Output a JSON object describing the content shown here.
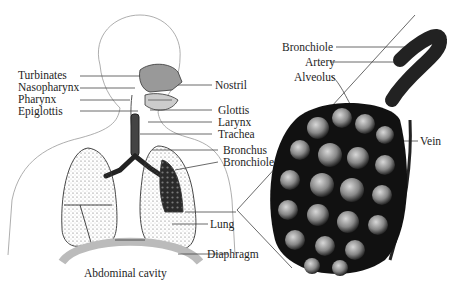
{
  "diagram": {
    "left_labels": {
      "turbinates": "Turbinates",
      "nasopharynx": "Nasopharynx",
      "pharynx": "Pharynx",
      "epiglottis": "Epiglottis"
    },
    "middle_labels": {
      "nostril": "Nostril",
      "glottis": "Glottis",
      "larynx": "Larynx",
      "trachea": "Trachea",
      "bronchus": "Bronchus",
      "bronchiole": "Bronchiole",
      "lung": "Lung",
      "diaphragm": "Diaphragm"
    },
    "bottom_label": "Abdominal cavity",
    "detail_labels": {
      "bronchiole": "Bronchiole",
      "artery": "Artery",
      "alveolus": "Alveolus",
      "vein": "Vein"
    }
  }
}
